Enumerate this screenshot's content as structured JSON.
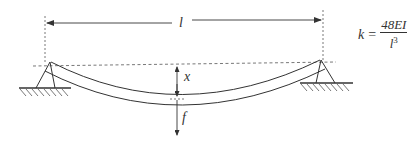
{
  "diagram": {
    "labels": {
      "span": "l",
      "deflection": "x",
      "force": "f"
    },
    "formula": {
      "lhs": "k",
      "equals": "=",
      "numerator": "48EI",
      "denominator_base": "l",
      "denominator_exponent": "3"
    },
    "colors": {
      "line": "#333333",
      "background": "#ffffff"
    }
  }
}
